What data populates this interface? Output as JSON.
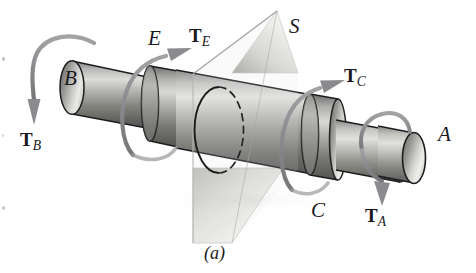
{
  "figure": {
    "caption": "(a)",
    "background_color": "#ffffff",
    "ink_color": "#19191c"
  },
  "labels": {
    "section_b": "B",
    "collar_e": "E",
    "plane_s": "S",
    "collar_c": "C",
    "section_a": "A"
  },
  "torques": [
    {
      "id": "T_B",
      "symbol": "T",
      "subscript": "B",
      "applied_at": "B",
      "direction": "arrow curves over top and points down on left end"
    },
    {
      "id": "T_E",
      "symbol": "T",
      "subscript": "E",
      "applied_at": "E",
      "direction": "arrow wraps shaft and points up to the right"
    },
    {
      "id": "T_C",
      "symbol": "T",
      "subscript": "C",
      "applied_at": "C",
      "direction": "arrow wraps shaft and points up to the right"
    },
    {
      "id": "T_A",
      "symbol": "T",
      "subscript": "A",
      "applied_at": "A",
      "direction": "arrow wraps shaft and points down"
    }
  ],
  "torque_labels": {
    "t_b": {
      "symbol": "T",
      "subscript": "B"
    },
    "t_e": {
      "symbol": "T",
      "subscript": "E"
    },
    "t_c": {
      "symbol": "T",
      "subscript": "C"
    },
    "t_a": {
      "symbol": "T",
      "subscript": "A"
    }
  },
  "geometry": {
    "shaft_axis": "runs from upper-left to lower-right",
    "segments": [
      {
        "name": "end-B",
        "role": "small-left-journal",
        "diameter_rank": 2
      },
      {
        "name": "collar-E",
        "role": "flange-collar",
        "diameter_rank": 4
      },
      {
        "name": "mid-large",
        "role": "largest-diameter-body",
        "diameter_rank": 5
      },
      {
        "name": "collar-C",
        "role": "flange-collar",
        "diameter_rank": 4
      },
      {
        "name": "step-down",
        "role": "intermediate-journal",
        "diameter_rank": 3
      },
      {
        "name": "end-A",
        "role": "small-right-journal",
        "diameter_rank": 1
      }
    ],
    "cut_plane": {
      "name": "S",
      "shape": "parallelogram",
      "intersection": "ellipse: solid front arc, dashed rear arc"
    }
  },
  "colors": {
    "metal_light": "#e6e6e4",
    "metal_mid": "#a9a9a7",
    "metal_dark": "#6e6e6d",
    "metal_darkest": "#4a4a4b",
    "outline": "#1d1d1f",
    "arrow_gray": "#8e8e92",
    "plane_light": "#f2f2f0",
    "plane_mid": "#c9c9c6",
    "dash": "#242426"
  }
}
